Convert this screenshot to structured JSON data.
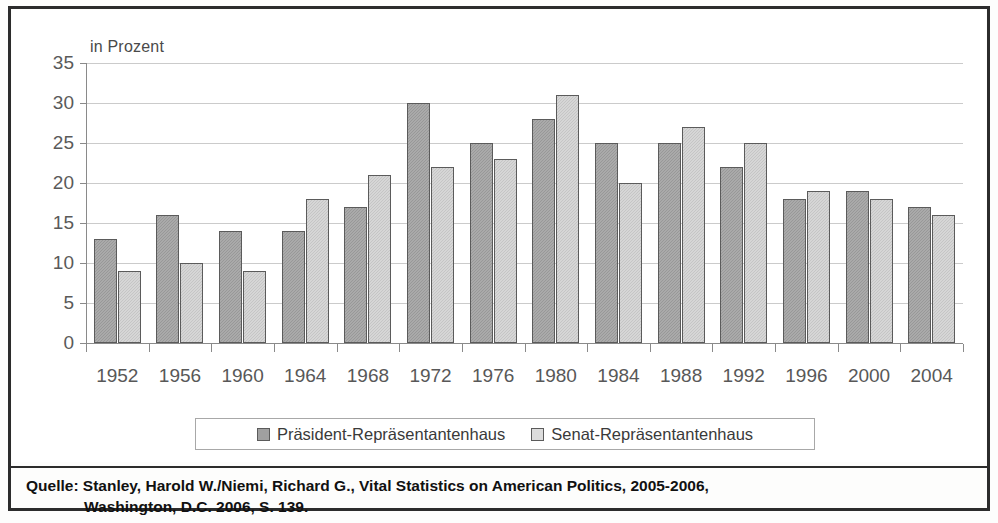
{
  "figure": {
    "axis_unit_label": "in Prozent",
    "source": {
      "label": "Quelle:",
      "line1": "Stanley, Harold W./Niemi, Richard G., Vital Statistics on American Politics, 2005-2006,",
      "line2": "Washington, D.C. 2006, S. 139."
    }
  },
  "colors": {
    "series_president": "#a0a0a0",
    "series_senate": "#cdcdcd",
    "bar_border": "#5b5b5b",
    "gridline": "#b9b9b9",
    "frame": "#2c2c2c",
    "axis_text": "#585858"
  },
  "chart_data": {
    "type": "bar",
    "title": "",
    "subtitle": "",
    "xlabel": "",
    "ylabel": "in Prozent",
    "ylim": [
      0,
      35
    ],
    "yticks": [
      0,
      5,
      10,
      15,
      20,
      25,
      30,
      35
    ],
    "ytick_labels": [
      "0",
      "5",
      "10",
      "15",
      "20",
      "25",
      "30",
      "35"
    ],
    "grid": true,
    "legend_position": "bottom",
    "categories": [
      "1952",
      "1956",
      "1960",
      "1964",
      "1968",
      "1972",
      "1976",
      "1980",
      "1984",
      "1988",
      "1992",
      "1996",
      "2000",
      "2004"
    ],
    "series": [
      {
        "name": "Präsident-Repräsentantenhaus",
        "color": "#a0a0a0",
        "values": [
          13,
          16,
          14,
          14,
          17,
          30,
          25,
          28,
          25,
          25,
          22,
          18,
          19,
          17
        ]
      },
      {
        "name": "Senat-Repräsentantenhaus",
        "color": "#cdcdcd",
        "values": [
          9,
          10,
          9,
          18,
          21,
          22,
          23,
          31,
          20,
          27,
          25,
          19,
          18,
          16
        ]
      }
    ]
  }
}
